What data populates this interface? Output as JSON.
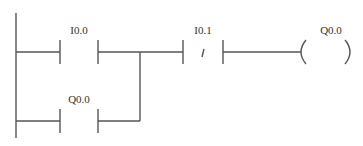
{
  "diagram": {
    "type": "ladder-logic",
    "rungs": [
      {
        "elements": [
          {
            "kind": "normally-open-contact",
            "label": "I0.0"
          },
          {
            "kind": "normally-closed-contact",
            "label": "I0.1",
            "symbol": "/"
          },
          {
            "kind": "coil",
            "label": "Q0.0"
          }
        ],
        "parallel_branch": {
          "kind": "normally-open-contact",
          "label": "Q0.0"
        }
      }
    ]
  }
}
